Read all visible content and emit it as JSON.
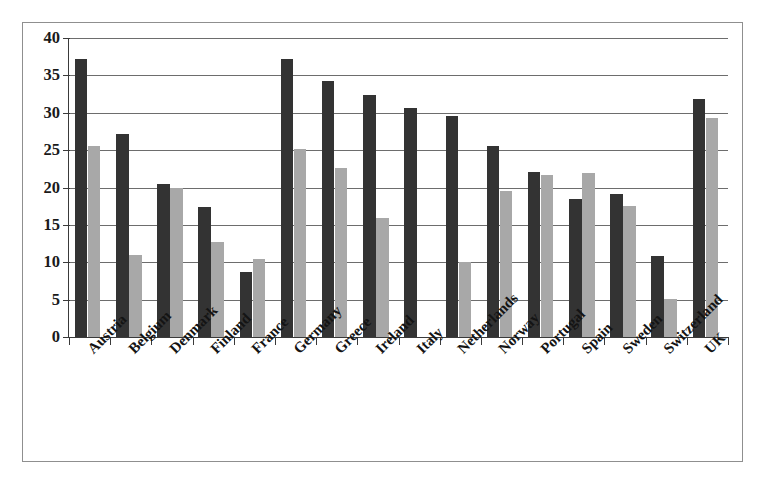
{
  "chart_data": {
    "type": "bar",
    "title": "",
    "subtitle": "",
    "xlabel": "",
    "ylabel": "",
    "ylim": [
      0,
      40
    ],
    "yticks": [
      0,
      5,
      10,
      15,
      20,
      25,
      30,
      35,
      40
    ],
    "ytick_labels": [
      "0",
      "5",
      "10",
      "15",
      "20",
      "25",
      "30",
      "35",
      "40"
    ],
    "grid": true,
    "legend": false,
    "legend_position": "none",
    "orientation": "vertical",
    "categories": [
      "Austria",
      "Belgium",
      "Denmark",
      "Finland",
      "France",
      "Germany",
      "Greece",
      "Ireland",
      "Italy",
      "Netherlands",
      "Norway",
      "Portugal",
      "Spain",
      "Sweden",
      "Switzerland",
      "UK"
    ],
    "series": [
      {
        "name": "Series 1",
        "color": "#333333",
        "values": [
          37.2,
          27.2,
          20.5,
          17.4,
          8.7,
          37.2,
          34.3,
          32.4,
          30.6,
          29.6,
          25.6,
          22.1,
          18.4,
          19.1,
          10.9,
          31.8
        ]
      },
      {
        "name": "Series 2",
        "color": "#a8a8a8",
        "values": [
          25.5,
          11.0,
          20.0,
          12.7,
          10.4,
          25.2,
          22.6,
          15.9,
          0,
          10.0,
          19.6,
          21.7,
          21.9,
          17.5,
          5.1,
          29.3
        ]
      }
    ]
  },
  "colors": {
    "series_dark": "#333333",
    "series_light": "#a8a8a8",
    "gridline": "#6d6d6d",
    "axis": "#3a3a3a",
    "frame": "#8f8f8f",
    "background": "#ffffff",
    "text": "#141414"
  }
}
